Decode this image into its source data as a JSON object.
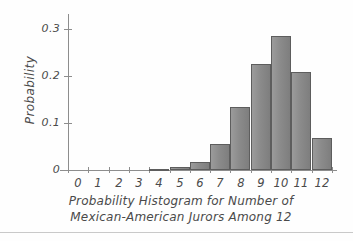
{
  "chart_data": {
    "type": "bar",
    "title": "Probability Histogram for Number of Mexican-American Jurors Among 12",
    "title_line1": "Probability Histogram for Number of",
    "title_line2": "Mexican-American Jurors Among 12",
    "xlabel": "",
    "ylabel": "Probability",
    "categories": [
      "0",
      "1",
      "2",
      "3",
      "4",
      "5",
      "6",
      "7",
      "8",
      "9",
      "10",
      "11",
      "12"
    ],
    "values": [
      0,
      0,
      0,
      0,
      0.002,
      0.006,
      0.016,
      0.055,
      0.135,
      0.226,
      0.285,
      0.208,
      0.068
    ],
    "ylim": [
      0,
      0.32
    ],
    "yticks": [
      0,
      0.1,
      0.2,
      0.3
    ],
    "ytick_labels": [
      "0",
      "0.1",
      "0.2",
      "0.3"
    ],
    "xtick_labels": [
      "0",
      "1",
      "2",
      "3",
      "4",
      "5",
      "6",
      "7",
      "8",
      "9",
      "10",
      "11",
      "12"
    ],
    "grid": false,
    "legend": false,
    "bar_color": "#8b8b8b",
    "bar_edge_color": "#5d5d5d",
    "axis_color": "#8d8d8d",
    "text_color": "#4a4a4a"
  }
}
